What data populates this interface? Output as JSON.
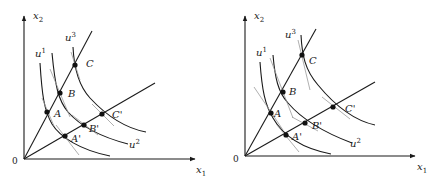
{
  "figure": {
    "panels": [
      {
        "id": "left",
        "axes": {
          "x_label": "x",
          "x_sub": "1",
          "y_label": "x",
          "y_sub": "2",
          "origin_label": "0"
        },
        "curves": [
          {
            "name": "u",
            "sup": "1"
          },
          {
            "name": "u",
            "sup": "2"
          },
          {
            "name": "u",
            "sup": "3"
          }
        ],
        "points": [
          {
            "label": "A"
          },
          {
            "label": "B"
          },
          {
            "label": "C"
          },
          {
            "label": "A'"
          },
          {
            "label": "B'"
          },
          {
            "label": "C'"
          }
        ]
      },
      {
        "id": "right",
        "axes": {
          "x_label": "x",
          "x_sub": "1",
          "y_label": "x",
          "y_sub": "2",
          "origin_label": "0"
        },
        "curves": [
          {
            "name": "u",
            "sup": "1"
          },
          {
            "name": "u",
            "sup": "2"
          },
          {
            "name": "u",
            "sup": "3"
          }
        ],
        "points": [
          {
            "label": "A"
          },
          {
            "label": "B"
          },
          {
            "label": "C"
          },
          {
            "label": "A'"
          },
          {
            "label": "B'"
          },
          {
            "label": "C'"
          }
        ]
      }
    ],
    "colors": {
      "ink": "#1a1a1a",
      "tangent": "#9a9a9a",
      "background": "#ffffff"
    }
  }
}
